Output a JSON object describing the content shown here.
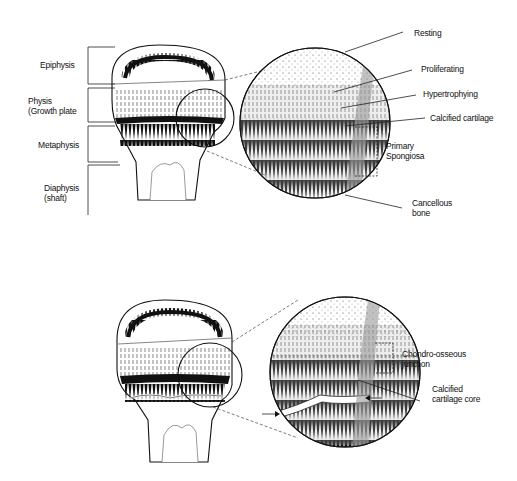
{
  "figure": {
    "top_panel": {
      "left_labels": [
        {
          "text": "Epiphysis"
        },
        {
          "text": "Physis"
        },
        {
          "text": "(Growth plate"
        },
        {
          "text": "Metaphysis"
        },
        {
          "text": "Diaphysis"
        },
        {
          "text": "(shaft)"
        }
      ],
      "right_labels": [
        {
          "text": "Resting"
        },
        {
          "text": "Proliferating"
        },
        {
          "text": "Hypertrophying"
        },
        {
          "text": "Calcified cartilage"
        },
        {
          "text": "Primary"
        },
        {
          "text": "Spongiosa"
        },
        {
          "text": "Cancellous"
        },
        {
          "text": "bone"
        }
      ]
    },
    "bottom_panel": {
      "right_labels": [
        {
          "text": "Chondro-osseous"
        },
        {
          "text": "junction"
        },
        {
          "text": "Calcified"
        },
        {
          "text": "cartilage core"
        }
      ]
    }
  }
}
